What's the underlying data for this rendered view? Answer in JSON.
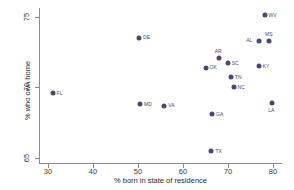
{
  "chart_data": {
    "type": "scatter",
    "title": "",
    "xlabel": "% born in state of residence",
    "ylabel": "% who own home",
    "xlim": [
      28,
      82
    ],
    "ylim": [
      64.6,
      75.6
    ],
    "xticks": [
      30,
      40,
      50,
      60,
      70,
      80
    ],
    "yticks": [
      65,
      70,
      75
    ],
    "grid": false,
    "legend": null,
    "marker_color": "#4a4a6a",
    "axis_color": "#8b8b8b",
    "points": [
      {
        "label": "WV",
        "x": 77.9,
        "y": 75.1,
        "label_pos": "right"
      },
      {
        "label": "MS",
        "x": 78.9,
        "y": 73.3,
        "label_pos": "above"
      },
      {
        "label": "AL",
        "x": 76.7,
        "y": 73.3,
        "label_pos": "left"
      },
      {
        "label": "DE",
        "x": 50.0,
        "y": 73.5,
        "label_pos": "right"
      },
      {
        "label": "AR",
        "x": 67.7,
        "y": 72.1,
        "label_pos": "above"
      },
      {
        "label": "SC",
        "x": 69.7,
        "y": 71.7,
        "label_pos": "right"
      },
      {
        "label": "OK",
        "x": 64.8,
        "y": 71.4,
        "label_pos": "right"
      },
      {
        "label": "KY",
        "x": 76.6,
        "y": 71.5,
        "label_pos": "right"
      },
      {
        "label": "TN",
        "x": 70.4,
        "y": 70.7,
        "label_pos": "right"
      },
      {
        "label": "NC",
        "x": 71.0,
        "y": 70.0,
        "label_pos": "right"
      },
      {
        "label": "FL",
        "x": 30.8,
        "y": 69.6,
        "label_pos": "right"
      },
      {
        "label": "LA",
        "x": 79.6,
        "y": 68.9,
        "label_pos": "below"
      },
      {
        "label": "MD",
        "x": 50.2,
        "y": 68.8,
        "label_pos": "right"
      },
      {
        "label": "VA",
        "x": 55.6,
        "y": 68.7,
        "label_pos": "right"
      },
      {
        "label": "GA",
        "x": 66.2,
        "y": 68.1,
        "label_pos": "right"
      },
      {
        "label": "TX",
        "x": 66.1,
        "y": 65.5,
        "label_pos": "right"
      }
    ]
  }
}
